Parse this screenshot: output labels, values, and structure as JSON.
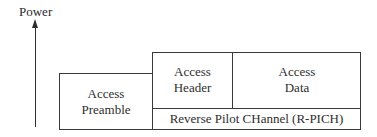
{
  "axis": {
    "label": "Power",
    "direction": "up",
    "arrow_icon": "arrow-up-icon"
  },
  "blocks": {
    "preamble": {
      "line1": "Access",
      "line2": "Preamble"
    },
    "header": {
      "line1": "Access",
      "line2": "Header"
    },
    "data": {
      "line1": "Access",
      "line2": "Data"
    },
    "pilot": {
      "label": "Reverse Pilot CHannel (R-PICH)"
    }
  },
  "colors": {
    "stroke": "#3a3a3a",
    "text": "#2e2e2e",
    "background": "#ffffff"
  }
}
